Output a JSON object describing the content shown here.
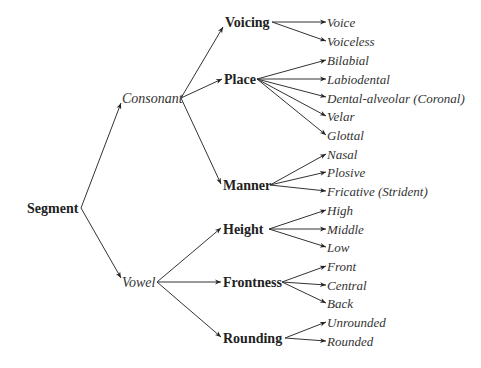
{
  "diagram": {
    "type": "tree",
    "root": "Segment",
    "classes": [
      {
        "label": "Consonant",
        "features": [
          {
            "label": "Voicing",
            "values": [
              "Voice",
              "Voiceless"
            ]
          },
          {
            "label": "Place",
            "values": [
              "Bilabial",
              "Labiodental",
              "Dental-alveolar (Coronal)",
              "Velar",
              "Glottal"
            ]
          },
          {
            "label": "Manner",
            "values": [
              "Nasal",
              "Plosive",
              "Fricative (Strident)"
            ]
          }
        ]
      },
      {
        "label": "Vowel",
        "features": [
          {
            "label": "Height",
            "values": [
              "High",
              "Middle",
              "Low"
            ]
          },
          {
            "label": "Frontness",
            "values": [
              "Front",
              "Central",
              "Back"
            ]
          },
          {
            "label": "Rounding",
            "values": [
              "Unrounded",
              "Rounded"
            ]
          }
        ]
      }
    ]
  },
  "colors": {
    "line": "#333333",
    "text": "#222222",
    "background": "#ffffff"
  }
}
